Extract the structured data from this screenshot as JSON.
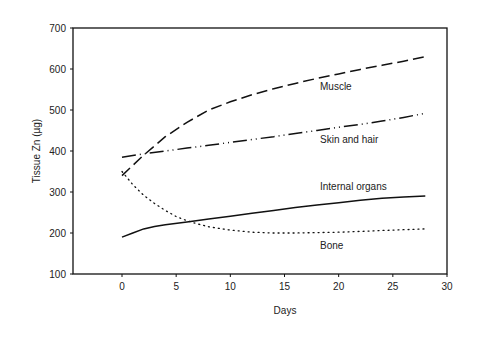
{
  "chart_data": {
    "type": "line",
    "title": "",
    "xlabel": "Days",
    "ylabel": "Tissue Zn (µg)",
    "xlim": [
      -9,
      30
    ],
    "ylim": [
      100,
      700
    ],
    "x_ticks": [
      0,
      5,
      10,
      15,
      20,
      25,
      30
    ],
    "y_ticks": [
      100,
      200,
      300,
      400,
      500,
      600,
      700
    ],
    "grid": false,
    "legend": "inline labels next to lines",
    "series": [
      {
        "name": "Muscle",
        "style": "long-dash",
        "x": [
          0,
          2,
          4,
          6,
          8,
          10,
          12,
          14,
          16,
          18,
          20,
          22,
          24,
          26,
          28
        ],
        "values": [
          340,
          390,
          435,
          470,
          500,
          520,
          537,
          552,
          565,
          577,
          588,
          599,
          609,
          619,
          630
        ]
      },
      {
        "name": "Skin and hair",
        "style": "dash-dot-dot",
        "x": [
          0,
          2,
          4,
          6,
          8,
          10,
          12,
          14,
          16,
          18,
          20,
          22,
          24,
          26,
          28
        ],
        "values": [
          385,
          393,
          400,
          407,
          414,
          421,
          428,
          435,
          443,
          450,
          458,
          465,
          473,
          482,
          492
        ]
      },
      {
        "name": "Internal organs",
        "style": "solid",
        "x": [
          0,
          1,
          2,
          3,
          4,
          6,
          8,
          10,
          12,
          14,
          16,
          18,
          20,
          22,
          24,
          26,
          28
        ],
        "values": [
          190,
          200,
          210,
          216,
          220,
          227,
          234,
          241,
          248,
          255,
          262,
          268,
          274,
          280,
          285,
          288,
          290
        ]
      },
      {
        "name": "Bone",
        "style": "dotted",
        "x": [
          0,
          1,
          2,
          3,
          4,
          5,
          6,
          7,
          8,
          10,
          12,
          14,
          16,
          18,
          20,
          22,
          24,
          26,
          28
        ],
        "values": [
          350,
          318,
          292,
          272,
          255,
          240,
          230,
          222,
          215,
          207,
          202,
          200,
          200,
          201,
          202,
          204,
          206,
          208,
          210
        ]
      }
    ]
  },
  "axes": {
    "x_label": "Days",
    "y_label": "Tissue Zn (µg)",
    "x_tick_labels": [
      "0",
      "5",
      "10",
      "15",
      "20",
      "25",
      "30"
    ],
    "y_tick_labels": [
      "100",
      "200",
      "300",
      "400",
      "500",
      "600",
      "700"
    ]
  },
  "labels": {
    "muscle": "Muscle",
    "skin": "Skin and hair",
    "internal": "Internal organs",
    "bone": "Bone"
  }
}
